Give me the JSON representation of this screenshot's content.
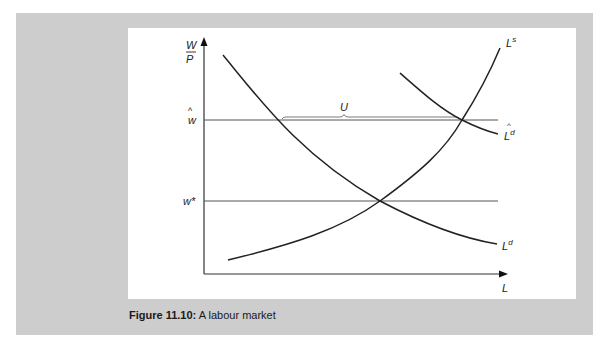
{
  "figure": {
    "caption_label": "Figure 11.10:",
    "caption_text": " A labour market"
  },
  "axes": {
    "y_label_top": "W",
    "y_label_bottom": "P",
    "x_label": "L",
    "w_hat_label": "w",
    "w_star_label": "w*"
  },
  "curves": {
    "supply_label": "L",
    "supply_sup": "s",
    "demand_label": "L",
    "demand_sup": "d",
    "demand_hat_label": "L",
    "demand_hat_sup": "d",
    "unemployment_label": "U"
  },
  "colors": {
    "panel": "#cdcdcd",
    "line": "#222222",
    "thin_line": "#555555"
  }
}
